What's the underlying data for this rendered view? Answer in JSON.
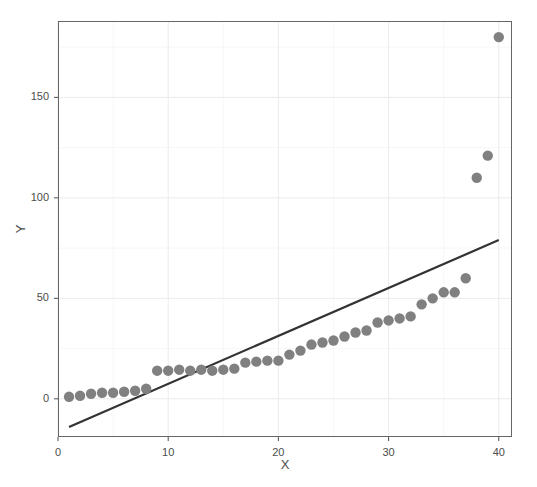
{
  "chart_data": {
    "type": "scatter",
    "title": "",
    "xlabel": "X",
    "ylabel": "Y",
    "xlim": [
      0.0,
      41.2
    ],
    "ylim": [
      -19,
      188
    ],
    "xticks": [
      0,
      10,
      20,
      30,
      40
    ],
    "yticks": [
      0,
      50,
      100,
      150
    ],
    "xtick_labels": [
      "0",
      "10",
      "20",
      "30",
      "40"
    ],
    "ytick_labels": [
      "0",
      "50",
      "100",
      "150"
    ],
    "grid": true,
    "legend": null,
    "point_color": "#808080",
    "point_size": 5.2,
    "line_color": "#333333",
    "line_width": 2.2,
    "background_color": "#ffffff",
    "panel_border_color": "#666666",
    "grid_color": "#ebebeb",
    "series": [
      {
        "name": "observations",
        "marker": "circle",
        "x": [
          1,
          2,
          3,
          4,
          5,
          6,
          7,
          8,
          9,
          10,
          11,
          12,
          13,
          14,
          15,
          16,
          17,
          18,
          19,
          20,
          21,
          22,
          23,
          24,
          25,
          26,
          27,
          28,
          29,
          30,
          31,
          32,
          33,
          34,
          35,
          36,
          37,
          38,
          39,
          40
        ],
        "y": [
          1,
          1.5,
          2.5,
          3,
          3,
          3.5,
          4,
          5,
          14,
          14,
          14.5,
          14,
          14.5,
          14,
          14.5,
          15,
          18,
          18.5,
          19,
          19,
          22,
          24,
          27,
          28,
          29,
          31,
          33,
          34,
          38,
          39,
          40,
          41,
          47,
          50,
          53,
          53,
          60,
          110,
          121,
          180
        ]
      }
    ],
    "fit_line": {
      "name": "linear-fit",
      "x": [
        1,
        40
      ],
      "y": [
        -14,
        79
      ]
    }
  }
}
